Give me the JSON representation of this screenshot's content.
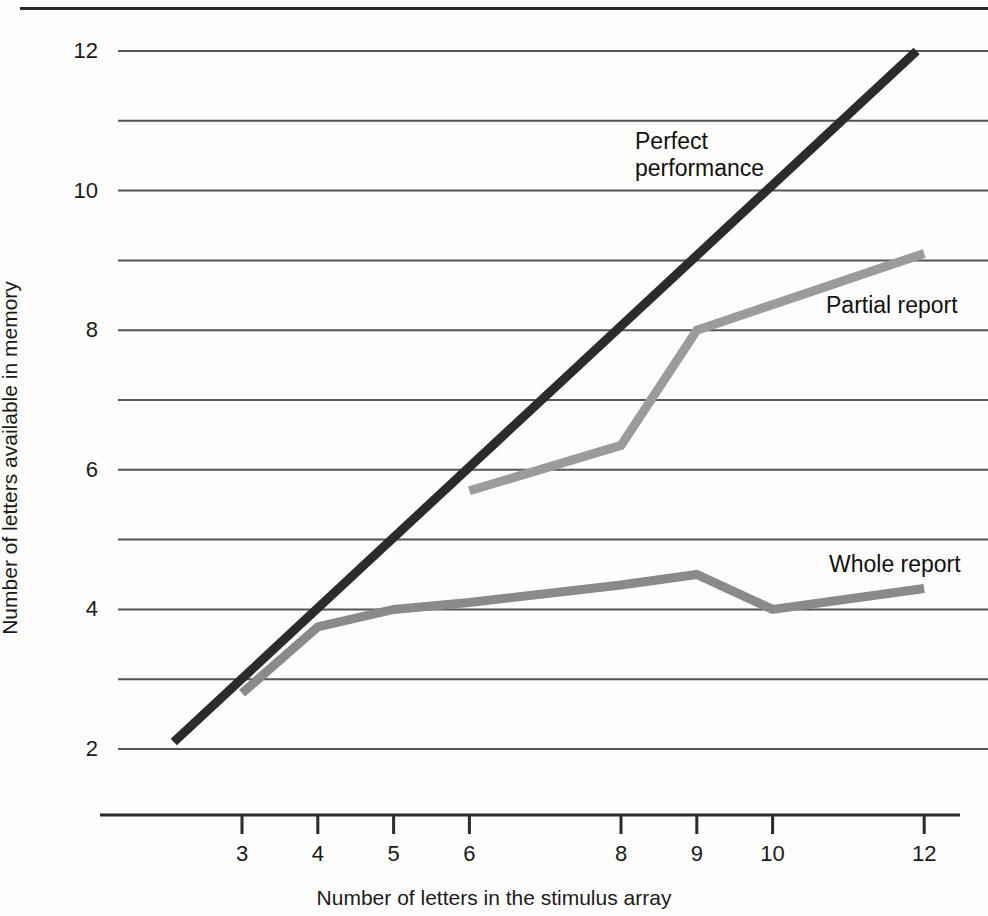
{
  "figure": {
    "background_color": "#fdfdfc",
    "top_rule_color": "#2b2b2b"
  },
  "chart_data": {
    "type": "line",
    "title": "",
    "subtitle": "",
    "xlabel": "Number of letters in the stimulus array",
    "ylabel": "Number of letters available in memory",
    "xlim": [
      2,
      12.4
    ],
    "ylim": [
      1.55,
      12.25
    ],
    "xticks": [
      3,
      4,
      5,
      6,
      8,
      9,
      10,
      12
    ],
    "xtick_labels": [
      "3",
      "4",
      "5",
      "6",
      "8",
      "9",
      "10",
      "12"
    ],
    "yticks": [
      2,
      4,
      6,
      8,
      10,
      12
    ],
    "ytick_labels": [
      "2",
      "4",
      "6",
      "8",
      "10",
      "12"
    ],
    "gridlines_y": [
      2,
      3,
      4,
      5,
      6,
      7,
      8,
      9,
      10,
      11,
      12
    ],
    "grid": true,
    "grid_color": "#555555",
    "legend": "inline-annotations",
    "series": [
      {
        "name": "Perfect performance",
        "label": "Perfect\nperformance",
        "color": "#2b2b2b",
        "width": 9,
        "label_x": 635,
        "label_y": 128,
        "x": [
          2.1,
          11.9
        ],
        "y": [
          2.1,
          12.0
        ]
      },
      {
        "name": "Partial report",
        "label": "Partial report",
        "color": "#9b9b9b",
        "width": 9,
        "label_x": 826,
        "label_y": 292,
        "x": [
          6,
          8,
          9,
          12
        ],
        "y": [
          5.7,
          6.35,
          8.0,
          9.1
        ]
      },
      {
        "name": "Whole report",
        "label": "Whole report",
        "color": "#8a8a8a",
        "width": 9,
        "label_x": 829,
        "label_y": 551,
        "x": [
          3,
          4,
          5,
          6,
          8,
          9,
          10,
          12
        ],
        "y": [
          2.8,
          3.75,
          4.0,
          4.1,
          4.35,
          4.5,
          4.0,
          4.3
        ]
      }
    ]
  }
}
